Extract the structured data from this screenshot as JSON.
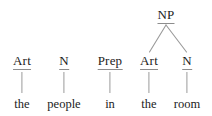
{
  "diagram": {
    "type": "syntax-tree",
    "sentence_fragment": "the people in the room",
    "colors": {
      "background": "#ffffff",
      "text": "#1c1c1c",
      "line": "#9a9a9a",
      "underline": "#8d8d8d"
    },
    "phrase_nodes": [
      {
        "id": "np",
        "label": "NP",
        "x": 166,
        "y": 14,
        "children": [
          "art2",
          "n2"
        ]
      }
    ],
    "pos_nodes": [
      {
        "id": "art1",
        "label": "Art",
        "x": 22,
        "y": 60,
        "word": "the",
        "word_x": 22,
        "word_y": 104
      },
      {
        "id": "n1",
        "label": "N",
        "x": 64,
        "y": 60,
        "word": "people",
        "word_x": 64,
        "word_y": 104
      },
      {
        "id": "prep",
        "label": "Prep",
        "x": 110,
        "y": 60,
        "word": "in",
        "word_x": 110,
        "word_y": 104
      },
      {
        "id": "art2",
        "label": "Art",
        "x": 149,
        "y": 60,
        "word": "the",
        "word_x": 149,
        "word_y": 104
      },
      {
        "id": "n2",
        "label": "N",
        "x": 187,
        "y": 60,
        "word": "room",
        "word_x": 187,
        "word_y": 104
      }
    ],
    "stems": [
      {
        "id": "stem-art1",
        "x": 22,
        "top": 72,
        "height": 21
      },
      {
        "id": "stem-n1",
        "x": 64,
        "top": 72,
        "height": 21
      },
      {
        "id": "stem-prep",
        "x": 110,
        "top": 72,
        "height": 21
      },
      {
        "id": "stem-art2",
        "x": 149,
        "top": 72,
        "height": 21
      },
      {
        "id": "stem-n2",
        "x": 187,
        "top": 72,
        "height": 21
      }
    ],
    "branches": [
      {
        "id": "np-to-art2",
        "x1": 166,
        "y1": 25,
        "x2": 149,
        "y2": 52
      },
      {
        "id": "np-to-n2",
        "x1": 166,
        "y1": 25,
        "x2": 187,
        "y2": 52
      }
    ]
  }
}
